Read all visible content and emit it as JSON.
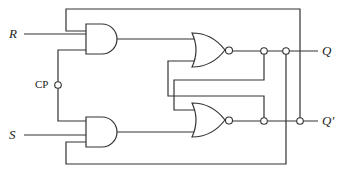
{
  "diagram": {
    "title": "",
    "type": "clocked SR flip-flop (gated NOR latch with feedback)",
    "labels": {
      "input_r": "R",
      "input_s": "S",
      "clock": "CP",
      "output_q": "Q",
      "output_q_bar": "Q′"
    },
    "gates": [
      {
        "id": "and-top",
        "type": "AND",
        "inputs": [
          "feedback from Q′",
          "R",
          "CP"
        ]
      },
      {
        "id": "and-bottom",
        "type": "AND",
        "inputs": [
          "CP",
          "S",
          "feedback from Q"
        ]
      },
      {
        "id": "nor-top",
        "type": "NOR",
        "inputs": [
          "and-top",
          "Q′"
        ],
        "output": "Q"
      },
      {
        "id": "nor-bottom",
        "type": "NOR",
        "inputs": [
          "Q",
          "and-bottom"
        ],
        "output": "Q′"
      }
    ]
  }
}
